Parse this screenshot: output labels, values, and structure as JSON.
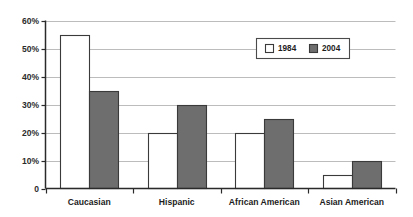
{
  "chart_data": {
    "type": "bar",
    "title": "",
    "xlabel": "",
    "ylabel": "",
    "ylim": [
      0,
      60
    ],
    "grid": true,
    "legend_position": "upper-right-inside",
    "categories": [
      "Caucasian",
      "Hispanic",
      "African American",
      "Asian American"
    ],
    "series": [
      {
        "name": "1984",
        "values": [
          55,
          20,
          20,
          5
        ],
        "color": "#ffffff"
      },
      {
        "name": "2004",
        "values": [
          35,
          30,
          25,
          10
        ],
        "color": "#6e6e6e"
      }
    ],
    "ytick_labels": [
      "60%",
      "50%",
      "40%",
      "30%",
      "20%",
      "10%",
      "0"
    ],
    "ytick_values": [
      60,
      50,
      40,
      30,
      20,
      10,
      0
    ]
  },
  "legend": {
    "entries": [
      {
        "label": "1984"
      },
      {
        "label": "2004"
      }
    ]
  },
  "colors": {
    "series_1984": "#ffffff",
    "series_2004": "#6e6e6e",
    "gridline": "#b4b4b4",
    "axis": "#2a2a2a",
    "bar_outline": "#3a3a3a",
    "background": "#ffffff"
  }
}
